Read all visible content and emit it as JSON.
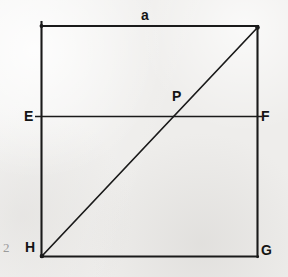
{
  "figure": {
    "caption_page_number": "2",
    "background_color": "#eeedeb",
    "ink_color": "#1a1a1a",
    "page_number_color": "#9b9b9b"
  },
  "labels": {
    "side_a": "a",
    "point_E": "E",
    "point_F": "F",
    "point_P": "P",
    "point_H": "H",
    "point_G": "G"
  },
  "geometry": {
    "square": {
      "left": 41,
      "right": 258,
      "top": 26,
      "bottom": 256
    },
    "ef_line": {
      "y": 116,
      "x_start": 35,
      "x_end": 262
    },
    "diagonal": {
      "x1": 42,
      "y1": 256,
      "x2": 258,
      "y2": 27
    },
    "intersection_P": {
      "x": 172,
      "y": 116
    }
  },
  "label_positions": {
    "side_a": {
      "x": 141,
      "y": 8
    },
    "point_E": {
      "x": 24,
      "y": 109
    },
    "point_F": {
      "x": 261,
      "y": 109
    },
    "point_P": {
      "x": 172,
      "y": 89
    },
    "point_H": {
      "x": 25,
      "y": 240
    },
    "point_G": {
      "x": 261,
      "y": 243
    },
    "page_number": {
      "x": 3,
      "y": 241
    }
  }
}
